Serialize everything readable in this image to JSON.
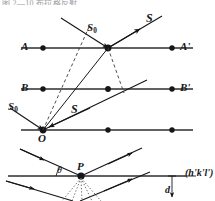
{
  "figure": {
    "name": "bragg-diffraction-lattice-planes-diagram",
    "cropped_caption_fragment": "图 2—10 布拉格反射",
    "colors": {
      "ink": "#16161a",
      "lattice_line": "#6f6f74",
      "dash": "#3a3a40",
      "dotted": "#55555b",
      "background": "#ffffff"
    },
    "upper_panel": {
      "name": "lattice-rows-scattering-panel",
      "rows": [
        {
          "id": "row-a",
          "left_label": "A",
          "right_label": "A'",
          "y": 48
        },
        {
          "id": "row-b",
          "left_label": "B",
          "right_label": "B'",
          "y": 89
        },
        {
          "id": "row-c",
          "left_label": "",
          "right_label": "",
          "y": 130
        }
      ],
      "vectors": [
        {
          "id": "incident-top",
          "label": "S",
          "subscript": "0",
          "role": "incident-beam-upper"
        },
        {
          "id": "scattered-top",
          "label": "S",
          "subscript": "",
          "role": "scattered-beam-upper"
        },
        {
          "id": "incident-origin",
          "label": "S",
          "subscript": "0",
          "role": "incident-beam-origin"
        },
        {
          "id": "scattered-origin",
          "label": "S",
          "subscript": "",
          "role": "scattered-beam-origin"
        }
      ],
      "origin_label": "O"
    },
    "lower_panel": {
      "name": "bragg-reflection-planes-panel",
      "scatter_point_label": "P",
      "angle_label": "θ",
      "plane_index_label": "(h'k'l')",
      "spacing_label": "d"
    }
  }
}
